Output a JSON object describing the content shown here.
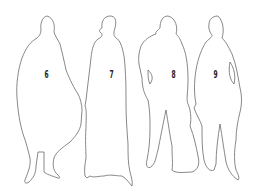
{
  "figures": [
    {
      "number": "6",
      "description": "wide cloaked figure"
    },
    {
      "number": "7",
      "description": "figure in long robe"
    },
    {
      "number": "8",
      "description": "standing figure holding bag"
    },
    {
      "number": "9",
      "description": "standing figure hand in pocket"
    }
  ],
  "colors": {
    "background": "#ffffff",
    "outline": "#6a6a6a",
    "label": "#222222"
  }
}
